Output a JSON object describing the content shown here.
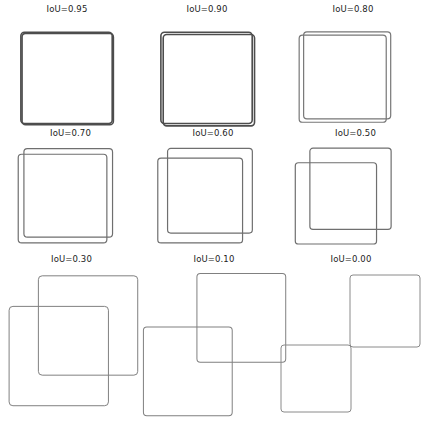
{
  "figure": {
    "width": 425,
    "height": 427,
    "background": "#ffffff",
    "columns": 3,
    "rows": 3
  },
  "chart_data": {
    "type": "diagram",
    "title": "",
    "panel_count": 9,
    "labels": [
      "IoU=0.95",
      "IoU=0.90",
      "IoU=0.80",
      "IoU=0.70",
      "IoU=0.60",
      "IoU=0.50",
      "IoU=0.30",
      "IoU=0.10",
      "IoU=0.00"
    ],
    "values": [
      0.95,
      0.9,
      0.8,
      0.7,
      0.6,
      0.5,
      0.3,
      0.1,
      0.0
    ],
    "grid": "off",
    "legend": "none",
    "panels": [
      {
        "label": "IoU=0.95",
        "iou": 0.95,
        "stroke": "#4d4d4d",
        "stroke_width": 1.6,
        "boxes": [
          {
            "name": "box-a",
            "x": 1,
            "y": 1,
            "w": 78,
            "h": 78
          },
          {
            "name": "box-b",
            "x": 2,
            "y": 2,
            "w": 78,
            "h": 78
          }
        ]
      },
      {
        "label": "IoU=0.90",
        "iou": 0.9,
        "stroke": "#4d4d4d",
        "stroke_width": 1.6,
        "boxes": [
          {
            "name": "box-a",
            "x": 1,
            "y": 1,
            "w": 78,
            "h": 78
          },
          {
            "name": "box-b",
            "x": 3,
            "y": 3,
            "w": 78,
            "h": 78
          }
        ]
      },
      {
        "label": "IoU=0.80",
        "iou": 0.8,
        "stroke": "#777777",
        "stroke_width": 1.2,
        "boxes": [
          {
            "name": "box-a",
            "x": 5,
            "y": 1,
            "w": 78,
            "h": 78
          },
          {
            "name": "box-b",
            "x": 1,
            "y": 4,
            "w": 78,
            "h": 78
          }
        ]
      },
      {
        "label": "IoU=0.70",
        "iou": 0.7,
        "stroke": "#6f6f6f",
        "stroke_width": 1.2,
        "boxes": [
          {
            "name": "box-a",
            "x": 6,
            "y": 1,
            "w": 78,
            "h": 78
          },
          {
            "name": "box-b",
            "x": 1,
            "y": 6,
            "w": 78,
            "h": 78
          }
        ]
      },
      {
        "label": "IoU=0.60",
        "iou": 0.6,
        "stroke": "#6f6f6f",
        "stroke_width": 1.2,
        "boxes": [
          {
            "name": "box-a",
            "x": 10,
            "y": 1,
            "w": 78,
            "h": 78
          },
          {
            "name": "box-b",
            "x": 1,
            "y": 10,
            "w": 78,
            "h": 78
          }
        ]
      },
      {
        "label": "IoU=0.50",
        "iou": 0.5,
        "stroke": "#6f6f6f",
        "stroke_width": 1.2,
        "boxes": [
          {
            "name": "box-a",
            "x": 15,
            "y": 1,
            "w": 78,
            "h": 78
          },
          {
            "name": "box-b",
            "x": 1,
            "y": 15,
            "w": 78,
            "h": 78
          }
        ]
      },
      {
        "label": "IoU=0.30",
        "iou": 0.3,
        "stroke": "#808080",
        "stroke_width": 1.0,
        "boxes": [
          {
            "name": "box-a",
            "x": 24,
            "y": 1,
            "w": 78,
            "h": 78
          },
          {
            "name": "box-b",
            "x": 1,
            "y": 25,
            "w": 78,
            "h": 78
          }
        ]
      },
      {
        "label": "IoU=0.10",
        "iou": 0.1,
        "stroke": "#808080",
        "stroke_width": 1.0,
        "boxes": [
          {
            "name": "box-a",
            "x": 48,
            "y": 1,
            "w": 78,
            "h": 78
          },
          {
            "name": "box-b",
            "x": 1,
            "y": 48,
            "w": 78,
            "h": 78
          }
        ]
      },
      {
        "label": "IoU=0.00",
        "iou": 0.0,
        "stroke": "#8a8a8a",
        "stroke_width": 1.0,
        "boxes": [
          {
            "name": "box-a",
            "x": 70,
            "y": 1,
            "w": 70,
            "h": 72
          },
          {
            "name": "box-b",
            "x": 1,
            "y": 71,
            "w": 70,
            "h": 67
          }
        ]
      }
    ]
  },
  "panel_geometry": [
    {
      "left": 8,
      "top": 4,
      "width": 118,
      "height": 118,
      "canvas_top": 20,
      "canvas_height": 96,
      "view": 82,
      "cx": 10,
      "cy": 6
    },
    {
      "left": 148,
      "top": 4,
      "width": 118,
      "height": 118,
      "canvas_top": 20,
      "canvas_height": 96,
      "view": 82,
      "cx": 10,
      "cy": 6
    },
    {
      "left": 288,
      "top": 4,
      "width": 130,
      "height": 118,
      "canvas_top": 20,
      "canvas_height": 96,
      "view": 86,
      "cx": 9,
      "cy": 6
    },
    {
      "left": 8,
      "top": 128,
      "width": 125,
      "height": 120,
      "canvas_top": 16,
      "canvas_height": 100,
      "view": 88,
      "cx": 8,
      "cy": 3
    },
    {
      "left": 148,
      "top": 128,
      "width": 130,
      "height": 120,
      "canvas_top": 16,
      "canvas_height": 100,
      "view": 92,
      "cx": 8,
      "cy": 3
    },
    {
      "left": 288,
      "top": 128,
      "width": 135,
      "height": 120,
      "canvas_top": 16,
      "canvas_height": 100,
      "view": 96,
      "cx": 6,
      "cy": 3
    },
    {
      "left": 4,
      "top": 254,
      "width": 135,
      "height": 170,
      "canvas_top": 18,
      "canvas_height": 148,
      "view": 106,
      "cx": 3,
      "cy": 2
    },
    {
      "left": 140,
      "top": 254,
      "width": 148,
      "height": 170,
      "canvas_top": 16,
      "canvas_height": 155,
      "view": 130,
      "cx": 2,
      "cy": 2
    },
    {
      "left": 278,
      "top": 254,
      "width": 146,
      "height": 170,
      "canvas_top": 18,
      "canvas_height": 155,
      "view": 146,
      "cx": 2,
      "cy": 2
    }
  ]
}
